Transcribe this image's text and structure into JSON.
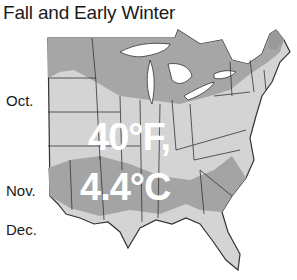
{
  "title": "Fall and Early Winter",
  "bands": [
    {
      "label": "Oct.",
      "color": "#a9a9a9"
    },
    {
      "label": "Nov.",
      "color": "#d3d3d3"
    },
    {
      "label": "Dec.",
      "color": "#a0a0a0"
    }
  ],
  "overlay": {
    "line1": "40°F,",
    "line2": "4.4°C"
  },
  "colors": {
    "dark_band": "#a4a4a4",
    "light_band": "#d4d4d4",
    "border": "#333333",
    "water": "#ffffff"
  }
}
